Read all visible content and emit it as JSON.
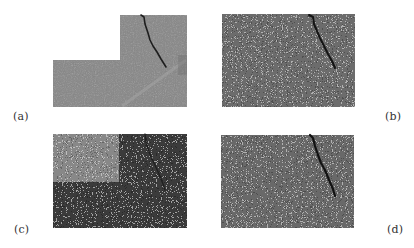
{
  "figure": {
    "panels": [
      {
        "id": "a",
        "label": "(a)",
        "description": "L-shaped grayscale concrete surface image with dark crack in upper-right block",
        "base_color": "#8a8a8a",
        "crack_color": "#1e1e1e"
      },
      {
        "id": "b",
        "label": "(b)",
        "description": "Noisy rectangular image with dark crack near top-right",
        "base_color": "#6e6e6e",
        "crack_color": "#151515"
      },
      {
        "id": "c",
        "label": "(c)",
        "description": "Noisy image with lighter upper-left block and darker remainder, faint crack",
        "light_block_color": "#8c8c8c",
        "dark_region_color": "#3a3a3a",
        "crack_color": "#1a1a1a"
      },
      {
        "id": "d",
        "label": "(d)",
        "description": "Noisy rectangular image with dark crack near top-right",
        "base_color": "#6e6e6e",
        "crack_color": "#151515"
      }
    ]
  }
}
